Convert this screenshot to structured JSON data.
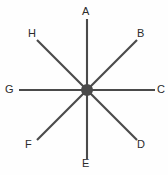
{
  "figure": {
    "kind": "radial-spoke-diagram",
    "background_color": "#fefefe",
    "line_color": "#4a4a4a",
    "label_color": "#2b2b2b",
    "hub": {
      "name": "center-hub",
      "x": 87,
      "y": 90,
      "radius": 6
    },
    "spokes": [
      {
        "id": "A",
        "label": "A",
        "angle_deg": 90,
        "x1": 87,
        "y1": 90,
        "x2": 87,
        "y2": 19,
        "label_x": 82,
        "label_y": 6
      },
      {
        "id": "B",
        "label": "B",
        "angle_deg": 45,
        "x1": 87,
        "y1": 90,
        "x2": 137,
        "y2": 40,
        "label_x": 137,
        "label_y": 28
      },
      {
        "id": "C",
        "label": "C",
        "angle_deg": 0,
        "x1": 87,
        "y1": 90,
        "x2": 155,
        "y2": 90,
        "label_x": 157,
        "label_y": 84
      },
      {
        "id": "D",
        "label": "D",
        "angle_deg": -45,
        "x1": 87,
        "y1": 90,
        "x2": 137,
        "y2": 140,
        "label_x": 137,
        "label_y": 139
      },
      {
        "id": "E",
        "label": "E",
        "angle_deg": -90,
        "x1": 87,
        "y1": 90,
        "x2": 87,
        "y2": 159,
        "label_x": 82,
        "label_y": 158
      },
      {
        "id": "F",
        "label": "F",
        "angle_deg": 225,
        "x1": 87,
        "y1": 90,
        "x2": 37,
        "y2": 140,
        "label_x": 25,
        "label_y": 139
      },
      {
        "id": "G",
        "label": "G",
        "angle_deg": 180,
        "x1": 87,
        "y1": 90,
        "x2": 19,
        "y2": 90,
        "label_x": 5,
        "label_y": 84
      },
      {
        "id": "H",
        "label": "H",
        "angle_deg": 135,
        "x1": 87,
        "y1": 90,
        "x2": 37,
        "y2": 40,
        "label_x": 28,
        "label_y": 28
      }
    ]
  },
  "chart_data": {
    "type": "scatter",
    "title": "",
    "subtitle": "",
    "xlabel": "",
    "ylabel": "",
    "grid": false,
    "legend": "none",
    "categories": [
      "A",
      "B",
      "C",
      "D",
      "E",
      "F",
      "G",
      "H"
    ],
    "values": [
      90,
      45,
      0,
      315,
      270,
      225,
      180,
      135
    ],
    "series": [
      {
        "name": "spoke-angle-degrees",
        "values": [
          90,
          45,
          0,
          315,
          270,
          225,
          180,
          135
        ]
      },
      {
        "name": "spoke-length-pixels",
        "values": [
          71,
          71,
          68,
          71,
          69,
          71,
          68,
          71
        ]
      }
    ],
    "xlim": [
      0,
      168
    ],
    "ylim": [
      0,
      175
    ]
  }
}
